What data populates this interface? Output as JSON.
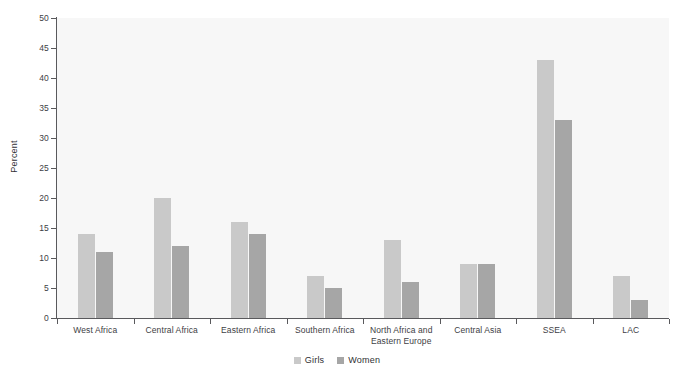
{
  "figure": {
    "title_fragment": "",
    "background": "#ffffff",
    "panel_background": "#f7f7f7"
  },
  "legend": {
    "position": "bottom-center",
    "entries": [
      {
        "label": "Girls",
        "color": "#c9c9c9",
        "icon": "square-swatch-icon"
      },
      {
        "label": "Women",
        "color": "#a6a6a6",
        "icon": "square-swatch-icon"
      }
    ]
  },
  "chart_data": {
    "type": "bar",
    "title": "",
    "xlabel": "",
    "ylabel": "Percent",
    "ylim": [
      0,
      50
    ],
    "ytick_step": 5,
    "yticks": [
      0,
      5,
      10,
      15,
      20,
      25,
      30,
      35,
      40,
      45,
      50
    ],
    "grid": false,
    "legend_position": "bottom-center",
    "categories": [
      "West Africa",
      "Central Africa",
      "Eastern Africa",
      "Southern Africa",
      "North Africa and Eastern Europe",
      "Central Asia",
      "SSEA",
      "LAC"
    ],
    "category_label_lines": [
      [
        "West Africa"
      ],
      [
        "Central Africa"
      ],
      [
        "Eastern Africa"
      ],
      [
        "Southern Africa"
      ],
      [
        "North Africa and",
        "Eastern Europe"
      ],
      [
        "Central Asia"
      ],
      [
        "SSEA"
      ],
      [
        "LAC"
      ]
    ],
    "series": [
      {
        "name": "Girls",
        "color": "#c9c9c9",
        "values": [
          14,
          20,
          16,
          7,
          13,
          9,
          43,
          7
        ]
      },
      {
        "name": "Women",
        "color": "#a6a6a6",
        "values": [
          11,
          12,
          14,
          5,
          6,
          9,
          33,
          3
        ]
      }
    ]
  }
}
